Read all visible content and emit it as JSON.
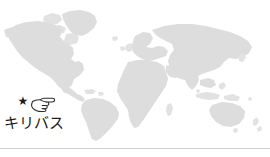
{
  "figure": {
    "type": "world-map-locator",
    "background_color": "#ffffff",
    "land_color": "#dddddd",
    "rule_color": "#cfcfcf"
  },
  "map": {
    "name": "world-map",
    "projection": "equirectangular",
    "regions": [
      "North America",
      "South America",
      "Greenland",
      "Europe",
      "Africa",
      "Asia",
      "Australia",
      "New Zealand",
      "Japan",
      "British Isles",
      "Madagascar",
      "Indonesia",
      "Philippines"
    ]
  },
  "annotation": {
    "star_glyph": "★",
    "star_name": "star-marker-icon",
    "star_color": "#1a1a1a",
    "hand_name": "pointing-hand-left-icon",
    "hand_glyph": "☜",
    "label": "キリバス",
    "label_color": "#1c1c1c"
  }
}
